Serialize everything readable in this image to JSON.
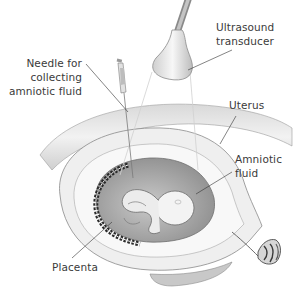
{
  "diagram": {
    "labels": {
      "needle": [
        "Needle for",
        "collecting",
        "amniotic fluid"
      ],
      "transducer": [
        "Ultrasound",
        "transducer"
      ],
      "uterus": [
        "Uterus"
      ],
      "amniotic_fluid": [
        "Amniotic",
        "fluid"
      ],
      "placenta": [
        "Placenta"
      ]
    },
    "colors": {
      "background": "#ffffff",
      "text": "#3a3a3a",
      "leader_line": "#333333",
      "uterus_wall": "#e6e6e6",
      "amniotic_fluid": "#b5b5b5",
      "fetus": "#f0f0f0",
      "placenta": "#2a2a2a"
    }
  }
}
